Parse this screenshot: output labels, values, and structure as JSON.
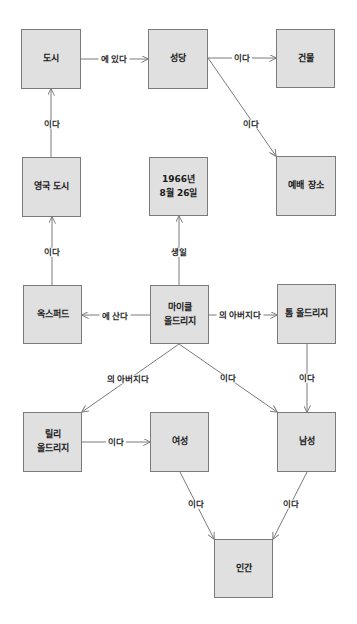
{
  "diagram": {
    "type": "knowledge-graph",
    "colors": {
      "node_fill": "#e0e0e0",
      "node_border": "#7a7a7a",
      "edge": "#7a7a7a",
      "text": "#1a1a1a"
    },
    "nodes": {
      "city": {
        "label": "도시"
      },
      "cathedral": {
        "label": "성당"
      },
      "building": {
        "label": "건물"
      },
      "uk_city": {
        "label": "영국 도시"
      },
      "date": {
        "label": "1966년\n8월 26일"
      },
      "worship": {
        "label": "예배 장소"
      },
      "oxford": {
        "label": "옥스퍼드"
      },
      "michael": {
        "label": "마이클\n올드리지"
      },
      "tom": {
        "label": "톰 올드리지"
      },
      "lily": {
        "label": "릴리\n올드리지"
      },
      "female": {
        "label": "여성"
      },
      "male": {
        "label": "남성"
      },
      "human": {
        "label": "인간"
      }
    },
    "edges": [
      {
        "from": "city",
        "to": "cathedral",
        "label": "에 있다"
      },
      {
        "from": "cathedral",
        "to": "building",
        "label": "이다"
      },
      {
        "from": "cathedral",
        "to": "worship",
        "label": "이다"
      },
      {
        "from": "uk_city",
        "to": "city",
        "label": "이다"
      },
      {
        "from": "oxford",
        "to": "uk_city",
        "label": "이다"
      },
      {
        "from": "michael",
        "to": "date",
        "label": "생일"
      },
      {
        "from": "michael",
        "to": "oxford",
        "label": "에 산다"
      },
      {
        "from": "michael",
        "to": "tom",
        "label": "의 아버지다"
      },
      {
        "from": "michael",
        "to": "lily",
        "label": "의 아버지다"
      },
      {
        "from": "michael",
        "to": "male",
        "label": "이다"
      },
      {
        "from": "tom",
        "to": "male",
        "label": "이다"
      },
      {
        "from": "lily",
        "to": "female",
        "label": "이다"
      },
      {
        "from": "female",
        "to": "human",
        "label": "이다"
      },
      {
        "from": "male",
        "to": "human",
        "label": "이다"
      }
    ]
  }
}
